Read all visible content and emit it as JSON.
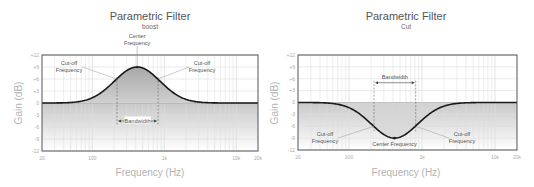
{
  "chart_data": [
    {
      "type": "line",
      "title": "Parametric Filter",
      "subtitle": "boost",
      "xlabel": "Frequency (Hz)",
      "ylabel": "Gain (dB)",
      "xscale": "log",
      "xlim": [
        20,
        20000
      ],
      "ylim": [
        -12,
        12
      ],
      "grid": true,
      "x_ticks": [
        {
          "value": 20,
          "label": "20"
        },
        {
          "value": 100,
          "label": "100"
        },
        {
          "value": 1000,
          "label": "1k"
        },
        {
          "value": 10000,
          "label": "10k"
        },
        {
          "value": 20000,
          "label": "20k"
        }
      ],
      "y_ticks": [
        {
          "value": 12,
          "label": "+12"
        },
        {
          "value": 9,
          "label": "+9"
        },
        {
          "value": 6,
          "label": "+6"
        },
        {
          "value": 3,
          "label": "+3"
        },
        {
          "value": 0,
          "label": "0"
        },
        {
          "value": -3,
          "label": "-3"
        },
        {
          "value": -6,
          "label": "-6"
        },
        {
          "value": -9,
          "label": "-9"
        },
        {
          "value": -12,
          "label": "-12"
        }
      ],
      "series": [
        {
          "name": "response",
          "center_hz": 420,
          "gain_db": 9,
          "bandwidth_low_hz": 220,
          "bandwidth_high_hz": 820,
          "x": [
            20,
            50,
            80,
            120,
            180,
            220,
            300,
            420,
            600,
            820,
            1100,
            1600,
            2500,
            20000
          ],
          "y": [
            0,
            0.1,
            0.5,
            1.6,
            4.2,
            6.0,
            8.0,
            9.0,
            8.0,
            6.0,
            4.0,
            1.6,
            0.3,
            0
          ]
        }
      ],
      "annotations": [
        {
          "text": [
            "Center",
            "Frequency"
          ],
          "target_hz": 420,
          "target_db": 9
        },
        {
          "text": [
            "Cut-off",
            "Frequency"
          ],
          "target_hz": 220,
          "target_db": 6.0,
          "side": "left"
        },
        {
          "text": [
            "Cut-off",
            "Frequency"
          ],
          "target_hz": 820,
          "target_db": 6.0,
          "side": "right"
        },
        {
          "text": [
            "Bandwidth"
          ],
          "type": "bandwidth",
          "from_hz": 220,
          "to_hz": 820,
          "at_db": -4.5
        }
      ]
    },
    {
      "type": "line",
      "title": "Parametric Filter",
      "subtitle": "Cut",
      "xlabel": "Frequency (Hz)",
      "ylabel": "Gain (dB)",
      "xscale": "log",
      "xlim": [
        20,
        20000
      ],
      "ylim": [
        -12,
        12
      ],
      "grid": true,
      "x_ticks": [
        {
          "value": 20,
          "label": "20"
        },
        {
          "value": 100,
          "label": "100"
        },
        {
          "value": 1000,
          "label": "1k"
        },
        {
          "value": 10000,
          "label": "10k"
        },
        {
          "value": 20000,
          "label": "20k"
        }
      ],
      "y_ticks": [
        {
          "value": 12,
          "label": "+12"
        },
        {
          "value": 9,
          "label": "+9"
        },
        {
          "value": 6,
          "label": "+6"
        },
        {
          "value": 3,
          "label": "+3"
        },
        {
          "value": 0,
          "label": "0"
        },
        {
          "value": -3,
          "label": "-3"
        },
        {
          "value": -6,
          "label": "-6"
        },
        {
          "value": -9,
          "label": "-9"
        },
        {
          "value": -12,
          "label": "-12"
        }
      ],
      "series": [
        {
          "name": "response",
          "center_hz": 420,
          "gain_db": -9,
          "bandwidth_low_hz": 220,
          "bandwidth_high_hz": 820,
          "x": [
            20,
            50,
            80,
            120,
            180,
            220,
            300,
            420,
            600,
            820,
            1100,
            1600,
            2500,
            20000
          ],
          "y": [
            0,
            -0.1,
            -0.5,
            -1.6,
            -4.2,
            -6.0,
            -8.0,
            -9.0,
            -8.0,
            -6.0,
            -4.0,
            -1.6,
            -0.3,
            0
          ]
        }
      ],
      "annotations": [
        {
          "text": [
            "Center Frequency"
          ],
          "target_hz": 420,
          "target_db": -9
        },
        {
          "text": [
            "Cut-off",
            "Frequency"
          ],
          "target_hz": 220,
          "target_db": -6.0,
          "side": "left"
        },
        {
          "text": [
            "Cut-off",
            "Frequency"
          ],
          "target_hz": 820,
          "target_db": -6.0,
          "side": "right"
        },
        {
          "text": [
            "Bandwidth"
          ],
          "type": "bandwidth",
          "from_hz": 220,
          "to_hz": 820,
          "at_db": 5
        }
      ]
    }
  ],
  "colors": {
    "curve": "#1a1a1a",
    "frame": "#555555",
    "grid": "#dddddd",
    "fill": "#bfbfbf",
    "annotation_line": "#888888"
  }
}
